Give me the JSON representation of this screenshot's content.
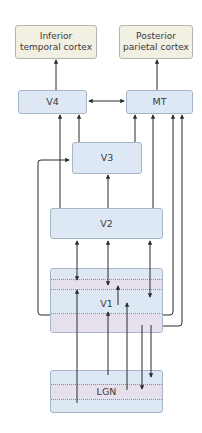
{
  "diagram": {
    "type": "visual-pathway-flow",
    "nodes": {
      "it": {
        "label_line1": "Inferior",
        "label_line2": "temporal cortex"
      },
      "pp": {
        "label_line1": "Posterior",
        "label_line2": "parietal cortex"
      },
      "v4": {
        "label": "V4"
      },
      "mt": {
        "label": "MT"
      },
      "v3": {
        "label": "V3"
      },
      "v2": {
        "label": "V2"
      },
      "v1": {
        "label": "V1"
      },
      "lgn": {
        "label": "LGN"
      }
    },
    "edges": [
      {
        "from": "V4",
        "to": "Inferior temporal cortex",
        "direction": "forward"
      },
      {
        "from": "MT",
        "to": "Posterior parietal cortex",
        "direction": "forward"
      },
      {
        "from": "V4",
        "to": "MT",
        "direction": "bidirectional"
      },
      {
        "from": "V3",
        "to": "V4",
        "direction": "forward"
      },
      {
        "from": "V3",
        "to": "MT",
        "direction": "forward"
      },
      {
        "from": "V2",
        "to": "V4",
        "direction": "forward"
      },
      {
        "from": "V2",
        "to": "MT",
        "direction": "forward"
      },
      {
        "from": "V2",
        "to": "V3",
        "direction": "forward"
      },
      {
        "from": "V1",
        "to": "V3",
        "direction": "forward"
      },
      {
        "from": "V1",
        "to": "V2",
        "direction": "bidirectional",
        "count": 3
      },
      {
        "from": "V1",
        "to": "MT",
        "direction": "forward",
        "count": 2
      },
      {
        "from": "LGN",
        "to": "V1",
        "direction": "forward",
        "count": 3
      },
      {
        "from": "V1",
        "to": "LGN",
        "direction": "feedback",
        "count": 2
      },
      {
        "from": "V1",
        "to": "V1",
        "direction": "intralaminar"
      }
    ],
    "colors": {
      "cortex_fill": "#f2efe3",
      "area_fill": "#dde8f4",
      "layer_pink": "#e6dfec",
      "line": "#2b2b2b"
    }
  }
}
